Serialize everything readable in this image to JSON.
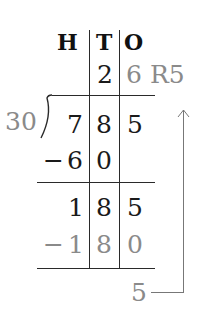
{
  "headers": {
    "hundreds": "H",
    "tens": "T",
    "ones": "O"
  },
  "quotient": {
    "tens": "2",
    "ones": "6",
    "remainder": "R5"
  },
  "divisor": "30",
  "dividend": {
    "hundreds": "7",
    "tens": "8",
    "ones": "5"
  },
  "step1_subtract": {
    "sign": "−",
    "hundreds": "6",
    "tens": "0"
  },
  "step2_partial": {
    "hundreds": "1",
    "tens": "8",
    "ones": "5"
  },
  "step2_subtract": {
    "sign": "−",
    "hundreds": "1",
    "tens": "8",
    "ones": "0"
  },
  "remainder": "5",
  "colors": {
    "dark": "#1a1a1a",
    "grey": "#8a8a8a",
    "line": "#2a2a2a"
  }
}
